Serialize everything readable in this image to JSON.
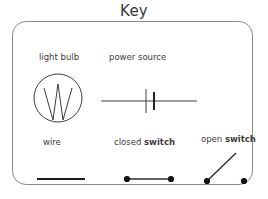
{
  "page": {
    "title": "Key",
    "background_color": "#ffffff",
    "ink_color": "#2b2b2b",
    "box_border_color": "#8b8b8b"
  },
  "legend": {
    "items": [
      {
        "id": "light-bulb",
        "label": "light bulb",
        "label_plain": "light bulb",
        "symbol": "circle-with-w-filament",
        "row": 1,
        "column": 1
      },
      {
        "id": "power-source",
        "label": "power source",
        "label_plain": "power source",
        "symbol": "battery-cell-two-bars-on-wire",
        "row": 1,
        "column": 2
      },
      {
        "id": "wire",
        "label": "wire",
        "label_plain": "wire",
        "symbol": "straight-horizontal-line",
        "row": 2,
        "column": 1
      },
      {
        "id": "closed-switch",
        "label_prefix": "closed ",
        "label_emphasis": "switch",
        "label_plain": "closed switch",
        "symbol": "two-terminals-joined-by-horizontal-line",
        "row": 2,
        "column": 2
      },
      {
        "id": "open-switch",
        "label_prefix": "open ",
        "label_emphasis": "switch",
        "label_plain": "open switch",
        "symbol": "two-terminals-with-lifted-diagonal-lever",
        "row": 2,
        "column": 3
      }
    ]
  }
}
